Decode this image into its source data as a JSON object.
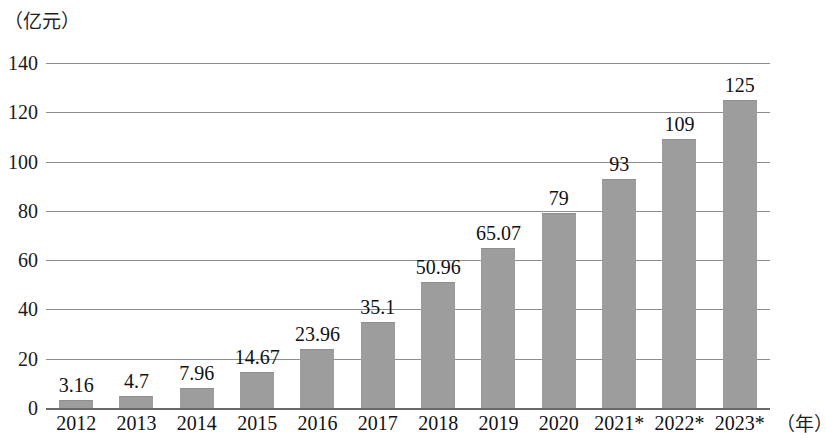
{
  "chart_data": {
    "type": "bar",
    "title": "",
    "subtitle": "",
    "xlabel": "（年）",
    "ylabel": "（亿元）",
    "categories": [
      "2012",
      "2013",
      "2014",
      "2015",
      "2016",
      "2017",
      "2018",
      "2019",
      "2020",
      "2021*",
      "2022*",
      "2023*"
    ],
    "values": [
      3.16,
      4.7,
      7.96,
      14.67,
      23.96,
      35.1,
      50.96,
      65.07,
      79,
      93,
      109,
      125
    ],
    "value_labels": [
      "3.16",
      "4.7",
      "7.96",
      "14.67",
      "23.96",
      "35.1",
      "50.96",
      "65.07",
      "79",
      "93",
      "109",
      "125"
    ],
    "ylim": [
      0,
      140
    ],
    "yticks": [
      0,
      20,
      40,
      60,
      80,
      100,
      120,
      140
    ],
    "ytick_labels": [
      "0",
      "20",
      "40",
      "60",
      "80",
      "100",
      "120",
      "140"
    ],
    "grid": true,
    "legend": false,
    "legend_position": "none",
    "series": [
      {
        "name": "",
        "values": [
          3.16,
          4.7,
          7.96,
          14.67,
          23.96,
          35.1,
          50.96,
          65.07,
          79,
          93,
          109,
          125
        ]
      }
    ],
    "colors": {
      "bar_fill": "#9d9d9d",
      "bar_edge": "#8e8e8e",
      "gridline": "#8d8d8d",
      "axis": "#6a6a6a",
      "text": "#111111",
      "background": "#ffffff"
    },
    "annotations": []
  }
}
